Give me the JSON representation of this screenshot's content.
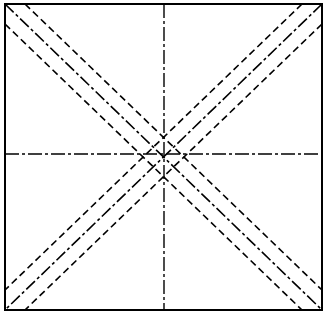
{
  "diagram": {
    "width": 326,
    "height": 315,
    "background": "#ffffff",
    "stroke_color": "#000000",
    "frame": {
      "x1": 5,
      "y1": 4,
      "x2": 322,
      "y2": 310,
      "stroke_width": 2
    },
    "center": {
      "x": 164,
      "y": 154
    },
    "centerlines": {
      "style": "dash-dot",
      "dasharray": "14 3 3 3",
      "stroke_width": 1.4
    },
    "diagonals": {
      "center_style": "dash-dot",
      "center_dasharray": "12 3 3 3",
      "parallel_style": "dashed",
      "parallel_dasharray": "7 4",
      "parallel_offset": 20,
      "stroke_width": 1.6
    }
  }
}
